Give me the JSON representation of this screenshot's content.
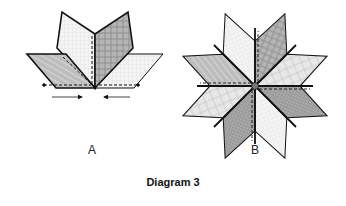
{
  "diagram": {
    "title": "Diagram 3",
    "panels": [
      {
        "label": "A",
        "description": "Four diamond pieces being joined; arrows point toward center seam"
      },
      {
        "label": "B",
        "description": "Eight-pointed star of diamonds with alternating fabric patterns, swirled center seams"
      }
    ],
    "colors": {
      "outline": "#111111",
      "fabric_light": "#f2f2f2",
      "fabric_medium": "#c9c9c9",
      "fabric_dark": "#a8a8a8",
      "fabric_grid": "#e4e4e4"
    }
  }
}
